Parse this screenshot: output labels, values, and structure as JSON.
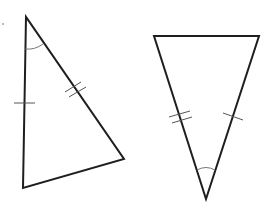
{
  "diagram": {
    "colors": {
      "edge": "#1e1e1e",
      "tick": "#555555",
      "arc": "#777777",
      "background": "#ffffff"
    },
    "triangles": [
      {
        "id": "triangle-left",
        "vertices": [
          [
            26,
            17
          ],
          [
            23,
            188
          ],
          [
            124,
            159
          ]
        ],
        "markings": {
          "single_tick_side": "left side (top to bottom-left)",
          "double_tick_side": "right side (top to right vertex)",
          "angle_arc_at": "top vertex"
        }
      },
      {
        "id": "triangle-right",
        "vertices": [
          [
            154,
            36
          ],
          [
            259,
            36
          ],
          [
            206,
            199
          ]
        ],
        "markings": {
          "double_tick_side": "left side (top-left to bottom)",
          "single_tick_side": "right side (top-right to bottom)",
          "angle_arc_at": "bottom vertex"
        }
      }
    ]
  }
}
